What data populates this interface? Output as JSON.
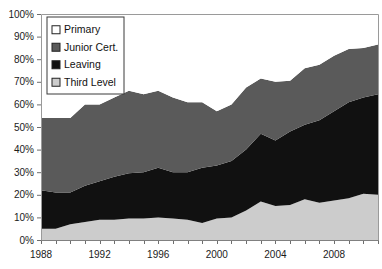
{
  "chart_data": {
    "type": "area",
    "stacked": true,
    "title": "",
    "xlabel": "",
    "ylabel": "",
    "ylim": [
      0,
      100
    ],
    "ytick_labels": [
      "0%",
      "10%",
      "20%",
      "30%",
      "40%",
      "50%",
      "60%",
      "70%",
      "80%",
      "90%",
      "100%"
    ],
    "ytick_values": [
      0,
      10,
      20,
      30,
      40,
      50,
      60,
      70,
      80,
      90,
      100
    ],
    "xlim": [
      1988,
      2011
    ],
    "xtick_labels": [
      "1988",
      "1992",
      "1996",
      "2000",
      "2004",
      "2008"
    ],
    "xtick_values": [
      1988,
      1992,
      1996,
      2000,
      2004,
      2008
    ],
    "x": [
      1988,
      1989,
      1990,
      1991,
      1992,
      1993,
      1994,
      1995,
      1996,
      1997,
      1998,
      1999,
      2000,
      2001,
      2002,
      2003,
      2004,
      2005,
      2006,
      2007,
      2008,
      2009,
      2010,
      2011
    ],
    "grid": false,
    "legend_position": "top-left",
    "series": [
      {
        "name": "Third Level",
        "color": "#cccccc",
        "values": [
          5,
          5,
          7,
          8,
          9,
          9,
          9.5,
          9.5,
          10,
          9.5,
          9,
          7.5,
          9.5,
          10,
          13,
          17,
          15,
          15.5,
          18,
          16.5,
          17.5,
          18.5,
          20.5,
          20
        ]
      },
      {
        "name": "Leaving",
        "color": "#111111",
        "values": [
          17,
          16,
          14,
          16,
          17,
          19,
          20,
          20.5,
          22,
          20.5,
          21,
          24.5,
          23.5,
          25,
          27,
          30,
          29,
          32.5,
          33,
          36.5,
          39.5,
          42.5,
          42.5,
          44.5
        ]
      },
      {
        "name": "Junior Cert.",
        "color": "#5a5a5a",
        "values": [
          32,
          33,
          33,
          36,
          34,
          35,
          36.5,
          34.5,
          34,
          33,
          31,
          29,
          24,
          25,
          27.5,
          24.5,
          26,
          22.5,
          25,
          24.5,
          24.5,
          23.5,
          22,
          22
        ]
      },
      {
        "name": "Primary",
        "color": "#ffffff",
        "values": [
          46,
          46,
          46,
          40,
          40,
          37,
          34,
          35.5,
          34,
          37,
          39,
          39,
          43,
          40,
          32.5,
          28.5,
          30,
          29.5,
          24,
          22.5,
          18.5,
          15.5,
          15,
          13.5
        ]
      }
    ],
    "legend": [
      {
        "label": "Primary",
        "color": "#ffffff"
      },
      {
        "label": "Junior Cert.",
        "color": "#5a5a5a"
      },
      {
        "label": "Leaving",
        "color": "#111111"
      },
      {
        "label": "Third Level",
        "color": "#cccccc"
      }
    ]
  }
}
